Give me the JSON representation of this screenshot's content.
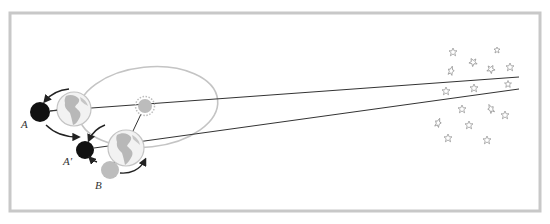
{
  "diagram": {
    "colors": {
      "frame": "#c8c8c8",
      "orbit": "#c4c4c4",
      "line": "#333333",
      "moon_dark": "#111111",
      "moon_light": "#bdbdbd",
      "earth_ocean": "#f2f2f2",
      "earth_land": "#b8b8b8",
      "sun": "#bcbcbc",
      "star": "#9a9a9a",
      "arrow": "#222222"
    },
    "labels": {
      "moon_a": "A",
      "moon_a_prime": "A′",
      "moon_b": "B"
    },
    "nodes": [
      {
        "id": "earth-1",
        "type": "earth",
        "cx": 74,
        "cy": 109,
        "r": 17
      },
      {
        "id": "earth-2",
        "type": "earth",
        "cx": 126,
        "cy": 148,
        "r": 18
      },
      {
        "id": "sun",
        "type": "sun",
        "cx": 145,
        "cy": 106,
        "r": 8
      },
      {
        "id": "moon-a",
        "type": "moon",
        "shade": "dark",
        "cx": 40,
        "cy": 112,
        "r": 10,
        "label": "A"
      },
      {
        "id": "moon-a-prime",
        "type": "moon",
        "shade": "dark",
        "cx": 85,
        "cy": 150,
        "r": 9,
        "label": "A′"
      },
      {
        "id": "moon-b",
        "type": "moon",
        "shade": "light",
        "cx": 110,
        "cy": 170,
        "r": 9,
        "label": "B"
      }
    ],
    "sight_lines": [
      {
        "from": "moon-a",
        "to": "distant-stars",
        "x1": 50,
        "y1": 111,
        "x2": 519,
        "y2": 77
      },
      {
        "from": "moon-a-prime",
        "to": "distant-stars",
        "x1": 94,
        "y1": 148,
        "x2": 519,
        "y2": 89
      }
    ],
    "star_count": 18
  }
}
